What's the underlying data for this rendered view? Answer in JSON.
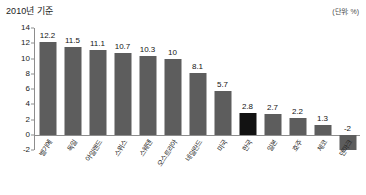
{
  "header": {
    "title": "2010년 기준",
    "unit": "(단위: %)"
  },
  "chart_data": {
    "type": "bar",
    "title": "2010년 기준",
    "xlabel": "",
    "ylabel": "",
    "unit": "(단위: %)",
    "ylim": [
      -2,
      14
    ],
    "yticks": [
      14,
      12,
      10,
      8,
      6,
      4,
      2,
      0,
      -2
    ],
    "grid": false,
    "legend": null,
    "categories": [
      "벨기에",
      "독일",
      "아일랜드",
      "스위스",
      "스웨덴",
      "오스트리아",
      "네덜란드",
      "미국",
      "한국",
      "일본",
      "호주",
      "체코",
      "덴마크"
    ],
    "values": [
      12.2,
      11.5,
      11.1,
      10.7,
      10.3,
      10,
      8.1,
      5.7,
      2.8,
      2.7,
      2.2,
      1.3,
      -2
    ],
    "value_labels": [
      "12.2",
      "11.5",
      "11.1",
      "10.7",
      "10.3",
      "10",
      "8.1",
      "5.7",
      "2.8",
      "2.7",
      "2.2",
      "1.3",
      "-2"
    ],
    "highlight_index": 8,
    "colors": {
      "bar": "#5d5d5d",
      "bar_highlight": "#121212",
      "axis": "#8d8d8d",
      "text": "#141414",
      "background": "#ffffff"
    }
  }
}
